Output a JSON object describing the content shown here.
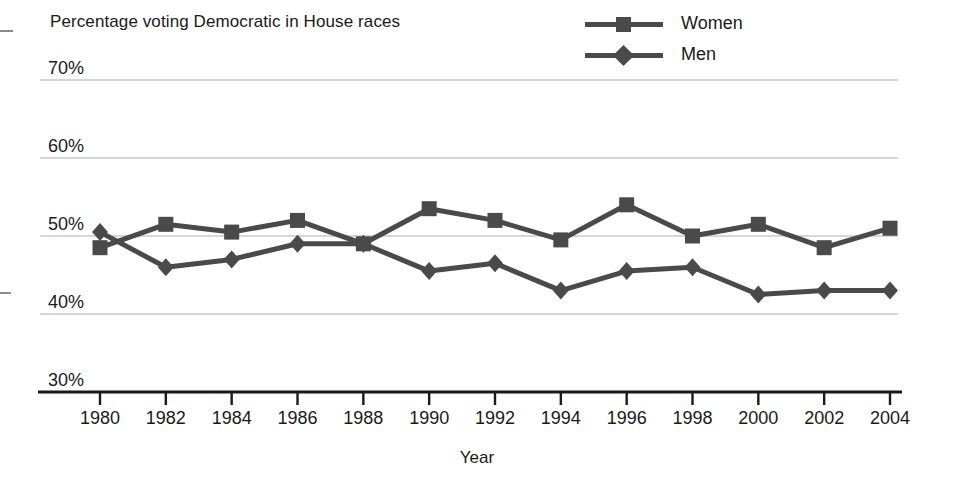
{
  "chart_data": {
    "type": "line",
    "title": "Percentage voting Democratic in House races",
    "xlabel": "Year",
    "ylabel": "",
    "x": [
      1980,
      1982,
      1984,
      1986,
      1988,
      1990,
      1992,
      1994,
      1996,
      1998,
      2000,
      2002,
      2004
    ],
    "categories": [
      "1980",
      "1982",
      "1984",
      "1986",
      "1988",
      "1990",
      "1992",
      "1994",
      "1996",
      "1998",
      "2000",
      "2002",
      "2004"
    ],
    "series": [
      {
        "name": "Women",
        "marker": "square",
        "color": "#4a4a4a",
        "values": [
          48.5,
          51.5,
          50.5,
          52.0,
          49.0,
          53.5,
          52.0,
          49.5,
          54.0,
          50.0,
          51.5,
          48.5,
          51.0
        ]
      },
      {
        "name": "Men",
        "marker": "diamond",
        "color": "#4a4a4a",
        "values": [
          50.5,
          46.0,
          47.0,
          49.0,
          49.0,
          45.5,
          46.5,
          43.0,
          45.5,
          46.0,
          42.5,
          43.0,
          43.0
        ]
      }
    ],
    "ylim": [
      30,
      70
    ],
    "yticks": [
      30,
      40,
      50,
      60,
      70
    ],
    "ytick_labels": [
      "30%",
      "40%",
      "50%",
      "60%",
      "70%"
    ],
    "grid": true,
    "legend_position": "top-right",
    "legend": [
      "Women",
      "Men"
    ]
  }
}
